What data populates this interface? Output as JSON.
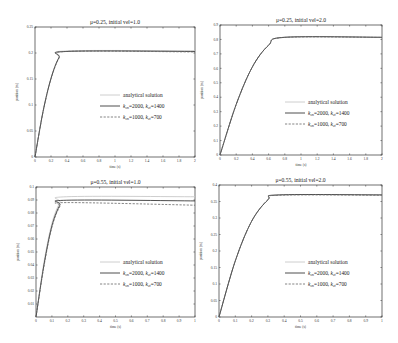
{
  "chart_data": [
    {
      "type": "line",
      "title": "μ=0.25, initial vel=1.0",
      "xlabel": "time (s)",
      "ylabel": "position (m)",
      "xlim": [
        0,
        2
      ],
      "ylim": [
        0,
        0.25
      ],
      "xticks": [
        0,
        0.2,
        0.4,
        0.6,
        0.8,
        1,
        1.2,
        1.4,
        1.6,
        1.8,
        2
      ],
      "yticks": [
        0,
        0.05,
        0.1,
        0.15,
        0.2,
        0.25
      ],
      "grid": false,
      "legend_position": "center right",
      "series": [
        {
          "name": "analytical solution",
          "style": "dotted-light",
          "x": [
            0,
            0.1,
            0.2,
            0.3,
            0.4,
            2
          ],
          "y": [
            0,
            0.088,
            0.152,
            0.192,
            0.204,
            0.204
          ]
        },
        {
          "name": "kcn=2000, kct=1400",
          "style": "solid",
          "x": [
            0,
            0.1,
            0.2,
            0.3,
            0.4,
            2
          ],
          "y": [
            0,
            0.087,
            0.151,
            0.191,
            0.203,
            0.203
          ]
        },
        {
          "name": "kcn=1000, kct=700",
          "style": "dashed",
          "x": [
            0,
            0.1,
            0.2,
            0.3,
            0.4,
            2
          ],
          "y": [
            0,
            0.086,
            0.15,
            0.19,
            0.203,
            0.202
          ]
        }
      ]
    },
    {
      "type": "line",
      "title": "μ=0.25, initial vel=2.0",
      "xlabel": "time (s)",
      "ylabel": "position (m)",
      "xlim": [
        0,
        2
      ],
      "ylim": [
        0,
        0.9
      ],
      "xticks": [
        0,
        0.2,
        0.4,
        0.6,
        0.8,
        1,
        1.2,
        1.4,
        1.6,
        1.8,
        2
      ],
      "yticks": [
        0,
        0.1,
        0.2,
        0.3,
        0.4,
        0.5,
        0.6,
        0.7,
        0.8,
        0.9
      ],
      "grid": false,
      "legend_position": "center right",
      "series": [
        {
          "name": "analytical solution",
          "style": "dotted-light",
          "x": [
            0,
            0.2,
            0.4,
            0.6,
            0.8,
            2
          ],
          "y": [
            0,
            0.35,
            0.61,
            0.76,
            0.815,
            0.815
          ]
        },
        {
          "name": "kcn=2000, kct=1400",
          "style": "solid",
          "x": [
            0,
            0.2,
            0.4,
            0.6,
            0.8,
            2
          ],
          "y": [
            0,
            0.35,
            0.61,
            0.76,
            0.815,
            0.815
          ]
        },
        {
          "name": "kcn=1000, kct=700",
          "style": "dashed",
          "x": [
            0,
            0.2,
            0.4,
            0.6,
            0.8,
            2
          ],
          "y": [
            0,
            0.35,
            0.61,
            0.76,
            0.814,
            0.814
          ]
        }
      ]
    },
    {
      "type": "line",
      "title": "μ=0.55, initial vel=1.0",
      "xlabel": "time (s)",
      "ylabel": "position (m)",
      "xlim": [
        0,
        1
      ],
      "ylim": [
        0,
        0.1
      ],
      "xticks": [
        0,
        0.1,
        0.2,
        0.3,
        0.4,
        0.5,
        0.6,
        0.7,
        0.8,
        0.9,
        1
      ],
      "yticks": [
        0.01,
        0.02,
        0.03,
        0.04,
        0.05,
        0.06,
        0.07,
        0.08,
        0.09,
        0.1
      ],
      "grid": false,
      "legend_position": "center right",
      "series": [
        {
          "name": "analytical solution",
          "style": "dotted-light",
          "x": [
            0,
            0.05,
            0.1,
            0.15,
            0.19,
            1
          ],
          "y": [
            0,
            0.042,
            0.072,
            0.088,
            0.0925,
            0.0925
          ]
        },
        {
          "name": "kcn=2000, kct=1400",
          "style": "solid",
          "x": [
            0,
            0.05,
            0.1,
            0.15,
            0.19,
            1
          ],
          "y": [
            0,
            0.04,
            0.07,
            0.086,
            0.0898,
            0.0893
          ]
        },
        {
          "name": "kcn=1000, kct=700",
          "style": "dashed",
          "x": [
            0,
            0.05,
            0.1,
            0.15,
            0.19,
            1
          ],
          "y": [
            0,
            0.039,
            0.069,
            0.085,
            0.088,
            0.086
          ]
        }
      ]
    },
    {
      "type": "line",
      "title": "μ=0.55, initial vel=2.0",
      "xlabel": "time (s)",
      "ylabel": "position (m)",
      "xlim": [
        0,
        1
      ],
      "ylim": [
        0,
        0.4
      ],
      "xticks": [
        0,
        0.1,
        0.2,
        0.3,
        0.4,
        0.5,
        0.6,
        0.7,
        0.8,
        0.9,
        1
      ],
      "yticks": [
        0,
        0.05,
        0.1,
        0.15,
        0.2,
        0.25,
        0.3,
        0.35,
        0.4
      ],
      "grid": false,
      "legend_position": "center right",
      "series": [
        {
          "name": "analytical solution",
          "style": "dotted-light",
          "x": [
            0,
            0.1,
            0.2,
            0.3,
            0.37,
            1
          ],
          "y": [
            0,
            0.17,
            0.29,
            0.355,
            0.37,
            0.37
          ]
        },
        {
          "name": "kcn=2000, kct=1400",
          "style": "solid",
          "x": [
            0,
            0.1,
            0.2,
            0.3,
            0.37,
            1
          ],
          "y": [
            0,
            0.17,
            0.29,
            0.355,
            0.37,
            0.37
          ]
        },
        {
          "name": "kcn=1000, kct=700",
          "style": "dashed",
          "x": [
            0,
            0.1,
            0.2,
            0.3,
            0.37,
            1
          ],
          "y": [
            0,
            0.17,
            0.29,
            0.355,
            0.369,
            0.369
          ]
        }
      ]
    }
  ],
  "panels": [
    {
      "title": "μ=0.25, initial vel=1.0",
      "xlabel": "time (s)",
      "ylabel": "position (m)"
    },
    {
      "title": "μ=0.25, initial vel=2.0",
      "xlabel": "time (s)",
      "ylabel": "position (m)"
    },
    {
      "title": "μ=0.55, initial vel=1.0",
      "xlabel": "time (s)",
      "ylabel": "position (m)"
    },
    {
      "title": "μ=0.55, initial vel=2.0",
      "xlabel": "time (s)",
      "ylabel": "position (m)"
    }
  ],
  "legend": [
    {
      "label": "analytical solution",
      "k1": "",
      "k1sub": "",
      "v1": "",
      "k2": "",
      "k2sub": "",
      "v2": ""
    },
    {
      "label": "",
      "k1": "k",
      "k1sub": "cn",
      "v1": "=2000, ",
      "k2": "k",
      "k2sub": "ct",
      "v2": "=1400"
    },
    {
      "label": "",
      "k1": "k",
      "k1sub": "cn",
      "v1": "=1000, ",
      "k2": "k",
      "k2sub": "ct",
      "v2": "=700"
    }
  ],
  "colors": {
    "axis": "#333333",
    "analytical": "#c8c8c8",
    "solid": "#3a3a3a",
    "dashed": "#666666"
  }
}
